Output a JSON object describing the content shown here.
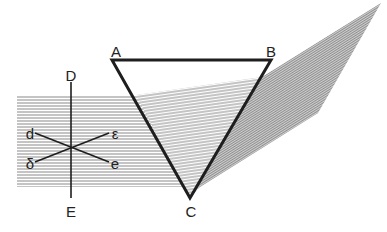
{
  "diagram": {
    "colors": {
      "line": "#1e1e1e",
      "hatch": "#8a8a8a",
      "spectrum_fill": "#b9b9b9",
      "background": "#ffffff"
    },
    "prism": {
      "vertices": {
        "A": [
          112,
          60
        ],
        "B": [
          271,
          60
        ],
        "C": [
          190,
          198
        ]
      },
      "labels": {
        "A": "A",
        "B": "B",
        "C": "C"
      }
    },
    "incident_beam": {
      "x_start": 17,
      "y_top": 95,
      "y_bottom": 187
    },
    "refracted_beam": {
      "top_left": [
        136,
        95
      ],
      "top_right": [
        262,
        77
      ]
    },
    "spectrum": {
      "points": [
        [
          262,
          77
        ],
        [
          381,
          3
        ],
        [
          318,
          113
        ],
        [
          200,
          187
        ]
      ]
    },
    "reference_line": {
      "x": 71,
      "y_top": 82,
      "y_bottom": 198,
      "label_top": "D",
      "label_bottom": "E"
    },
    "cross": {
      "center": [
        71,
        146
      ],
      "labels": {
        "d": "d",
        "epsilon": "ε",
        "delta": "δ",
        "e": "e"
      }
    }
  }
}
